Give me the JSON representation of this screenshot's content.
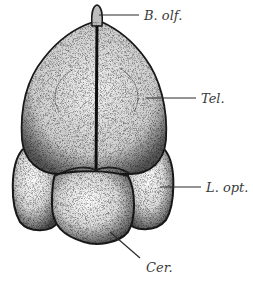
{
  "figure": {
    "ink_color": "#1a1a1a",
    "label_color": "#3a3a3a",
    "background": "#ffffff"
  },
  "labels": [
    {
      "id": "b-olf",
      "text": "B. olf.",
      "meaning": "Bulbus olfactorius"
    },
    {
      "id": "tel",
      "text": "Tel.",
      "meaning": "Telencephalon"
    },
    {
      "id": "l-opt",
      "text": "L. opt.",
      "meaning": "Lobus opticus"
    },
    {
      "id": "cer",
      "text": "Cer.",
      "meaning": "Cerebellum"
    }
  ]
}
